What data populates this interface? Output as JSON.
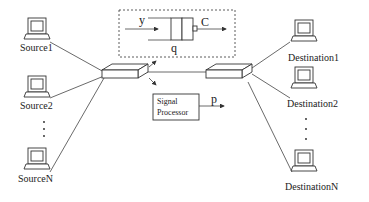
{
  "diagram": {
    "sources": [
      {
        "label": "Source1"
      },
      {
        "label": "Source2"
      },
      {
        "label": "SourceN"
      }
    ],
    "destinations": [
      {
        "label": "Destination1"
      },
      {
        "label": "Destination2"
      },
      {
        "label": "DestinationN"
      }
    ],
    "ellipsis": "⋮",
    "queue": {
      "input_label": "y",
      "output_label": "C",
      "queue_label": "q"
    },
    "signal_processor": {
      "line1": "Signal",
      "line2": "Processor",
      "output_label": "p"
    }
  }
}
